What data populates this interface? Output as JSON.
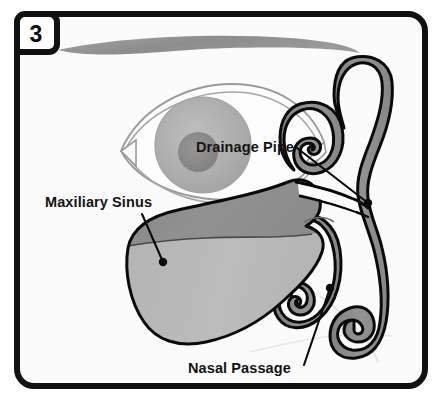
{
  "figure": {
    "panel_number": "3",
    "title_alt": "Maxillary sinus drainage diagram",
    "frame_border_color": "#111111",
    "background_color": "#fbfbfb"
  },
  "colors": {
    "outline": "#0a0a0a",
    "tissue_mid_grey": "#8d8d8d",
    "sinus_upper_grey": "#8a8a8a",
    "sinus_lower_grey": "#b6b6b6",
    "eyebrow_grey": "#909090",
    "eye_outline_grey": "#9a9a9a",
    "iris_grey": "#b0b0b0",
    "pupil_grey": "#8a8a8a",
    "sclera_white": "#fdfdfd",
    "label_text": "#141414"
  },
  "labels": [
    {
      "id": "drainage-pipe",
      "text": "Drainage Pipe",
      "text_x": 196,
      "text_y": 152,
      "anchor": "start",
      "leader_from_x": 297,
      "leader_from_y": 148,
      "leader_to_x": 368,
      "leader_to_y": 203,
      "dot_x": 368,
      "dot_y": 203,
      "dot_r": 4.2
    },
    {
      "id": "maxiliary-sinus",
      "text": "Maxiliary Sinus",
      "text_x": 45,
      "text_y": 207,
      "anchor": "start",
      "leader_from_x": 142,
      "leader_from_y": 214,
      "leader_to_x": 163,
      "leader_to_y": 262,
      "dot_x": 163,
      "dot_y": 262,
      "dot_r": 4.2
    },
    {
      "id": "nasal-passage",
      "text": "Nasal Passage",
      "text_x": 188,
      "text_y": 373,
      "anchor": "start",
      "leader_from_x": 304,
      "leader_from_y": 365,
      "leader_to_x": 330,
      "leader_to_y": 288,
      "dot_x": 330,
      "dot_y": 288,
      "dot_r": 4.2
    }
  ],
  "anatomy": {
    "eyebrow_name": "eyebrow-crescent",
    "eye_name": "eye-cross-section",
    "sinus_name": "maxillary-sinus-cavity",
    "nasal_wall_name": "nasal-cavity-wall",
    "turbinate_upper_name": "superior-turbinate",
    "turbinate_middle_name": "middle-turbinate",
    "turbinate_inferior_name": "inferior-turbinate",
    "drainage_channel_name": "drainage-ostium-channel",
    "fluid_level_name": "sinus-fluid-level-line"
  }
}
